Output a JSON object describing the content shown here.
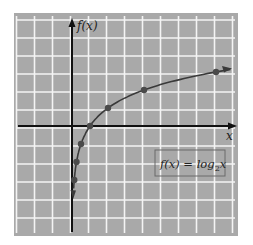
{
  "chart_data": {
    "type": "line",
    "title": "",
    "function_label": "f(x) = log₂x",
    "function_label_parts": {
      "lhs": "f(x) = log",
      "base": "2",
      "arg": "x"
    },
    "xlabel": "x",
    "ylabel": "f(x)",
    "xlim": [
      -3,
      9
    ],
    "ylim": [
      -6,
      6
    ],
    "grid": true,
    "legend_position": "lower-right (boxed equation)",
    "series": [
      {
        "name": "f(x) = log2 x",
        "points": [
          {
            "x": 0.125,
            "y": -3
          },
          {
            "x": 0.25,
            "y": -2
          },
          {
            "x": 0.5,
            "y": -1
          },
          {
            "x": 1,
            "y": 0
          },
          {
            "x": 2,
            "y": 1
          },
          {
            "x": 4,
            "y": 2
          },
          {
            "x": 8,
            "y": 3
          }
        ]
      }
    ]
  },
  "colors": {
    "panel": "#a9a9a9",
    "gridline": "#f4f4f4",
    "axis": "#111111",
    "curve": "#3a3a3a",
    "point": "#4a4a4a",
    "label_box": "#6a6a6a"
  },
  "labels": {
    "y_axis": "f(x)",
    "x_axis": "x",
    "equation_lhs": "f(x) = log",
    "equation_base": "2",
    "equation_arg": "x"
  }
}
